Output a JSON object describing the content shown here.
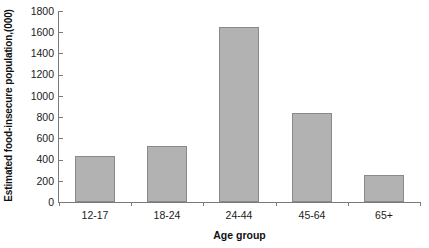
{
  "chart_data": {
    "type": "bar",
    "title": "",
    "xlabel": "Age group",
    "ylabel": "Estimated food-insecure population,(000)",
    "categories": [
      "12-17",
      "18-24",
      "24-44",
      "45-64",
      "65+"
    ],
    "values": [
      430,
      530,
      1650,
      840,
      250
    ],
    "series": [
      {
        "name": "Estimated food-insecure population",
        "values": [
          430,
          530,
          1650,
          840,
          250
        ]
      }
    ],
    "ylim": [
      0,
      1800
    ],
    "ytick_step": 200,
    "yticks": [
      0,
      200,
      400,
      600,
      800,
      1000,
      1200,
      1400,
      1600,
      1800
    ],
    "ytick_labels": [
      "0",
      "200",
      "400",
      "600",
      "800",
      "1000",
      "1200",
      "1400",
      "1600",
      "1800"
    ],
    "grid": false,
    "legend": false,
    "legend_position": "none",
    "bar_color": "#b2b2b2",
    "bar_border_color": "#8a8a8a",
    "axis_color": "#7a7a7a"
  }
}
